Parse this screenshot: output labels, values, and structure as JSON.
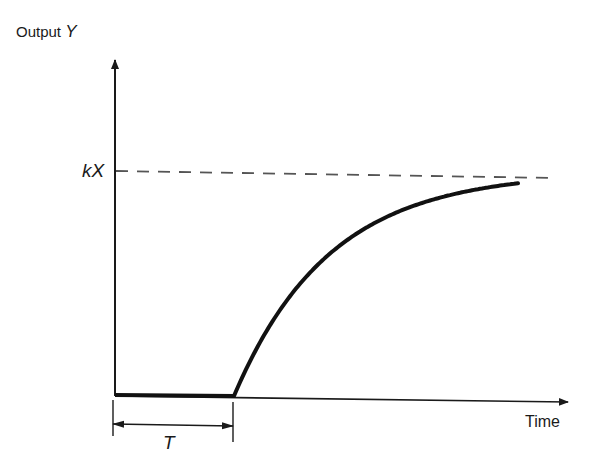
{
  "diagram": {
    "y_axis": {
      "label": "Output",
      "symbol": "Y"
    },
    "x_axis": {
      "label": "Time"
    },
    "asymptote": {
      "label": "kX",
      "style": "dashed"
    },
    "dead_time": {
      "label": "T"
    },
    "response": {
      "type": "first-order-plus-dead-time",
      "initial_value": 0,
      "final_value_label": "kX",
      "description": "Output stays at zero until time T, then rises exponentially toward kX"
    },
    "colors": {
      "ink": "#1a1a1a",
      "background": "#ffffff"
    }
  }
}
